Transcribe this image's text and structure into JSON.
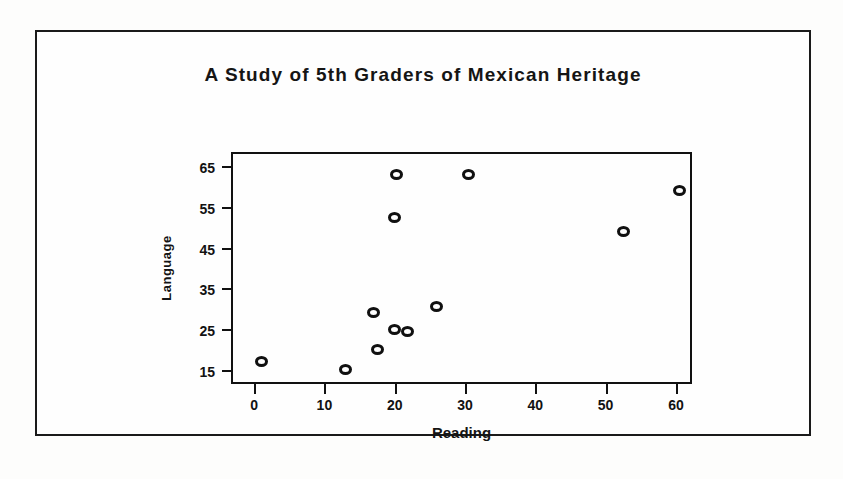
{
  "chart_data": {
    "type": "scatter",
    "title": "A Study of 5th Graders of Mexican Heritage",
    "xlabel": "Reading",
    "ylabel": "Language",
    "xlim": [
      -3,
      62
    ],
    "ylim": [
      12,
      68
    ],
    "xticks": [
      0,
      10,
      20,
      30,
      40,
      50,
      60
    ],
    "yticks": [
      15,
      25,
      35,
      45,
      55,
      65
    ],
    "xtick_labels": [
      "0",
      "10",
      "20",
      "30",
      "40",
      "50",
      "60"
    ],
    "ytick_labels": [
      "15",
      "25",
      "35",
      "45",
      "55",
      "65"
    ],
    "grid": false,
    "legend": false,
    "marker": "open-circle",
    "series": [
      {
        "name": "Students",
        "points": [
          {
            "x": 1,
            "y": 17
          },
          {
            "x": 13,
            "y": 15
          },
          {
            "x": 17,
            "y": 29
          },
          {
            "x": 17.5,
            "y": 20
          },
          {
            "x": 20,
            "y": 25
          },
          {
            "x": 20,
            "y": 52.5
          },
          {
            "x": 20.3,
            "y": 63
          },
          {
            "x": 21.8,
            "y": 24.5
          },
          {
            "x": 26,
            "y": 30.5
          },
          {
            "x": 30.5,
            "y": 63
          },
          {
            "x": 52.5,
            "y": 49
          },
          {
            "x": 60.5,
            "y": 59
          }
        ]
      }
    ]
  }
}
